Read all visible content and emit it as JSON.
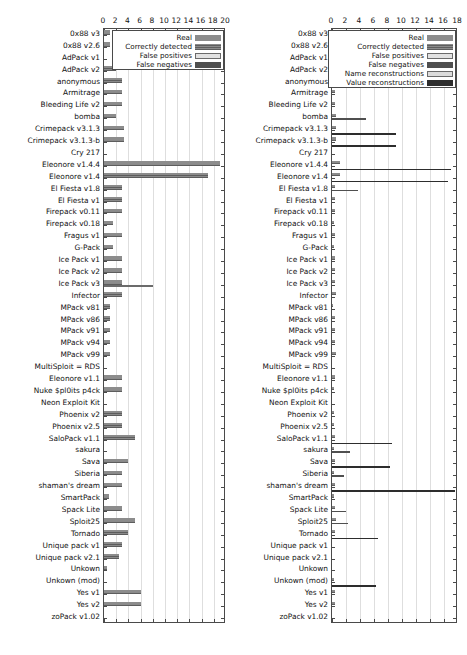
{
  "chart_data": [
    {
      "id": "left",
      "type": "bar",
      "orientation": "horizontal",
      "title": "",
      "xlabel": "",
      "ylabel": "",
      "xlim": [
        0,
        20
      ],
      "xticks": [
        0,
        2,
        4,
        6,
        8,
        10,
        12,
        14,
        16,
        18,
        20
      ],
      "grid": true,
      "legend_position": "top-right",
      "legend": [
        "Real",
        "Correctly detected",
        "False positives",
        "False negatives"
      ],
      "categories": [
        "0x88 v3",
        "0x88 v2.6",
        "AdPack v1",
        "AdPack v2",
        "anonymous",
        "Armitrage",
        "Bleeding Life v2",
        "bomba",
        "Crimepack v3.1.3",
        "Crimepack v3.1.3-b",
        "Cry 217",
        "Eleonore v1.4.4",
        "Eleonore v1.4",
        "El Fiesta v1.8",
        "El Fiesta v1",
        "Firepack v0.11",
        "Firepack v0.18",
        "Fragus v1",
        "G-Pack",
        "Ice Pack v1",
        "Ice Pack v2",
        "Ice Pack v3",
        "Infector",
        "MPack v81",
        "MPack v86",
        "MPack v91",
        "MPack v94",
        "MPack v99",
        "MultiSploit = RDS",
        "Eleonore v1.1",
        "Nuke $pl0its p4ck",
        "Neon Exploit Kit",
        "Phoenix v2",
        "Phoenix v2.5",
        "SaloPack v1.1",
        "sakura",
        "Sava",
        "Siberia",
        "shaman's dream",
        "SmartPack",
        "Spack Lite",
        "Sploit25",
        "Tornado",
        "Unique pack v1",
        "Unique pack  v2.1",
        "Unkown",
        "Unkown (mod)",
        "Yes v1",
        "Yes v2",
        "zoPack v1.02"
      ],
      "series": [
        {
          "name": "Real",
          "values": [
            1,
            1,
            0,
            2,
            3,
            3,
            3,
            2,
            3.2,
            3.2,
            0,
            19,
            17,
            3,
            3,
            3,
            1.5,
            3,
            1.5,
            3,
            3,
            3,
            3,
            1,
            1,
            1,
            1,
            1,
            0,
            3,
            3,
            0,
            3,
            3,
            5,
            0,
            4,
            3,
            3,
            0.8,
            3,
            5,
            4,
            3,
            2.5,
            0.5,
            0,
            6,
            6,
            0
          ]
        },
        {
          "name": "Correctly detected",
          "values": [
            1,
            1,
            0,
            2,
            3,
            3,
            3,
            2,
            3.2,
            3.2,
            0,
            19,
            17,
            3,
            3,
            3,
            1.5,
            3,
            1.5,
            3,
            3,
            3,
            3,
            1,
            1,
            1,
            1,
            1,
            0,
            3,
            3,
            0,
            3,
            3,
            5,
            0,
            4,
            3,
            3,
            0.8,
            3,
            5,
            4,
            3,
            2.5,
            0.5,
            0,
            6,
            6,
            0
          ]
        },
        {
          "name": "False positives",
          "values": [
            0,
            0,
            0,
            0,
            0,
            0,
            0,
            0,
            0,
            0,
            0,
            0,
            0,
            0,
            0,
            0,
            0,
            0,
            0,
            0,
            0,
            8,
            0,
            0,
            0,
            0,
            0,
            0,
            0,
            0,
            0,
            0,
            0,
            0,
            0,
            0,
            0,
            0,
            0,
            0,
            0,
            0,
            0,
            0,
            0,
            0,
            0,
            0,
            0,
            0
          ]
        },
        {
          "name": "False negatives",
          "values": [
            0,
            0,
            0,
            0,
            0,
            0,
            0,
            0,
            0,
            0,
            0,
            0,
            0,
            0,
            0,
            0,
            0,
            0,
            0,
            0,
            0,
            0,
            0,
            0,
            0,
            0,
            0,
            0,
            0,
            0,
            0,
            0,
            0,
            0,
            0,
            0,
            0,
            0,
            0,
            0,
            0,
            0,
            0,
            0,
            0,
            0,
            0,
            0,
            0,
            0
          ]
        }
      ]
    },
    {
      "id": "right",
      "type": "bar",
      "orientation": "horizontal",
      "title": "",
      "xlabel": "",
      "ylabel": "",
      "xlim": [
        0,
        18
      ],
      "xticks": [
        0,
        2,
        4,
        6,
        8,
        10,
        12,
        14,
        16,
        18
      ],
      "grid": true,
      "legend_position": "top-right",
      "legend": [
        "Real",
        "Correctly detected",
        "False positives",
        "False negatives",
        "Name reconstructions",
        "Value reconstructions"
      ],
      "categories": [
        "0x88 v3",
        "0x88 v2.6",
        "AdPack v1",
        "AdPack v2",
        "anonymous",
        "Armitrage",
        "Bleeding Life v2",
        "bomba",
        "Crimepack v3.1.3",
        "Crimepack v3.1.3-b",
        "Cry 217",
        "Eleonore v1.4.4",
        "Eleonore v1.4",
        "El Fiesta v1.8",
        "El Fiesta v1",
        "Firepack v0.11",
        "Firepack v0.18",
        "Fragus v1",
        "G-Pack",
        "Ice Pack v1",
        "Ice Pack v2",
        "Ice Pack v3",
        "Infector",
        "MPack v81",
        "MPack v86",
        "MPack v91",
        "MPack v94",
        "MPack v99",
        "MultiSploit = RDS",
        "Eleonore v1.1",
        "Nuke $pl0its p4ck",
        "Neon Exploit Kit",
        "Phoenix v2",
        "Phoenix v2.5",
        "SaloPack v1.1",
        "sakura",
        "Sava",
        "Siberia",
        "shaman's dream",
        "SmartPack",
        "Spack Lite",
        "Sploit25",
        "Tornado",
        "Unique pack v1",
        "Unique pack  v2.1",
        "Unkown",
        "Unkown (mod)",
        "Yes v1",
        "Yes v2",
        "zoPack v1.02"
      ],
      "series": [
        {
          "name": "Real",
          "values": [
            0.4,
            0.4,
            0.3,
            0.9,
            0.4,
            0.4,
            0.4,
            0.5,
            0.5,
            0.5,
            0,
            1.2,
            1.2,
            0.4,
            0.4,
            0.4,
            0.3,
            0.4,
            0.3,
            0.4,
            0.4,
            0.4,
            0.5,
            0.2,
            0.4,
            0.4,
            0.4,
            0.5,
            0,
            0.4,
            0.3,
            0,
            0.3,
            0.3,
            0.4,
            0.3,
            0.4,
            0.3,
            0.4,
            0.3,
            0.4,
            0.5,
            0.4,
            0,
            0,
            0,
            0.3,
            0.4,
            0.4,
            0
          ]
        },
        {
          "name": "Correctly detected",
          "values": [
            0.4,
            0.4,
            0.3,
            0.9,
            0.4,
            0.4,
            0.4,
            0.5,
            0.5,
            0.5,
            0,
            1.2,
            1.2,
            0.4,
            0.4,
            0.4,
            0.3,
            0.4,
            0.3,
            0.4,
            0.4,
            0.4,
            0.5,
            0.2,
            0.4,
            0.4,
            0.4,
            0.5,
            0,
            0.4,
            0.3,
            0,
            0.3,
            0.3,
            0.4,
            0.3,
            0.4,
            0.3,
            0.4,
            0.3,
            0.4,
            0.5,
            0.4,
            0,
            0,
            0,
            0.3,
            0.4,
            0.4,
            0
          ]
        },
        {
          "name": "False positives",
          "values": [
            0,
            0,
            0,
            0,
            0,
            0,
            0,
            0,
            0,
            0,
            0,
            0,
            0,
            0,
            0,
            0,
            0,
            0,
            0,
            0,
            0,
            0,
            0,
            0,
            0,
            0,
            0,
            0,
            0,
            0,
            0,
            0,
            0,
            0,
            0,
            0,
            0,
            0,
            0,
            0,
            0,
            0,
            0,
            0,
            0,
            0,
            0,
            0,
            0,
            0
          ]
        },
        {
          "name": "False negatives",
          "values": [
            0,
            0,
            0,
            0,
            0,
            0,
            0,
            4.8,
            0,
            0,
            0,
            0,
            0,
            3.7,
            0,
            0,
            0,
            0,
            0,
            0,
            0,
            0,
            0,
            0,
            0,
            0,
            0,
            0,
            0,
            0,
            0,
            0,
            0,
            0,
            0,
            2.6,
            0,
            1.7,
            0,
            0,
            2.0,
            2.3,
            0,
            0,
            0,
            0,
            0,
            0,
            0,
            0
          ]
        },
        {
          "name": "Name reconstructions",
          "values": [
            0,
            0,
            0,
            0,
            0,
            0,
            0,
            0,
            0,
            0,
            0,
            0,
            0,
            0,
            0,
            0,
            0,
            0,
            0,
            0,
            0,
            0,
            0,
            0,
            0,
            0,
            0,
            0,
            0,
            0,
            0,
            0,
            0,
            0,
            0,
            0,
            0,
            0,
            0,
            0,
            0,
            0,
            0,
            0,
            0,
            0,
            0,
            0,
            0,
            0
          ]
        },
        {
          "name": "Value reconstructions",
          "values": [
            0,
            0,
            0,
            0,
            0,
            0,
            0,
            0,
            9.2,
            9.2,
            0,
            17,
            16.5,
            0,
            0,
            0,
            0,
            0,
            0,
            0,
            0,
            0,
            0,
            0,
            0,
            0,
            0,
            0,
            0,
            0,
            0,
            0,
            0,
            0,
            8.5,
            0,
            8.3,
            0,
            17.6,
            0,
            0,
            0,
            6.6,
            0,
            0,
            0,
            6.3,
            0,
            0,
            0
          ]
        }
      ]
    }
  ]
}
